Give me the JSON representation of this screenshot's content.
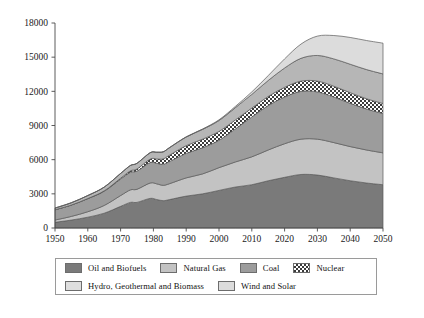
{
  "chart_data": {
    "type": "area",
    "stacked": true,
    "title": "",
    "xlabel": "",
    "ylabel": "",
    "xlim": [
      1950,
      2050
    ],
    "ylim": [
      0,
      18000
    ],
    "yticks": [
      0,
      3000,
      6000,
      9000,
      12000,
      15000,
      18000
    ],
    "ytick_labels": [
      "0",
      "3000",
      "6000",
      "9000",
      "12000",
      "15000",
      "18000"
    ],
    "xticks": [
      1950,
      1960,
      1970,
      1980,
      1990,
      2000,
      2010,
      2020,
      2030,
      2040,
      2050
    ],
    "xtick_labels": [
      "1950",
      "1960",
      "1970",
      "1980",
      "1990",
      "2000",
      "2010",
      "2020",
      "2030",
      "2040",
      "2050"
    ],
    "grid": false,
    "legend_position": "below",
    "x": [
      1950,
      1955,
      1960,
      1965,
      1970,
      1973,
      1975,
      1979,
      1981,
      1983,
      1985,
      1990,
      1995,
      2000,
      2005,
      2010,
      2015,
      2020,
      2025,
      2030,
      2035,
      2040,
      2045,
      2050
    ],
    "series": [
      {
        "name": "Oil and Biofuels",
        "color": "#7a7a7a",
        "pattern": "solid",
        "values": [
          500,
          700,
          950,
          1300,
          1900,
          2250,
          2250,
          2600,
          2500,
          2400,
          2500,
          2800,
          3000,
          3300,
          3600,
          3800,
          4150,
          4450,
          4700,
          4650,
          4400,
          4150,
          3950,
          3800
        ]
      },
      {
        "name": "Natural Gas",
        "color": "#c3c3c3",
        "pattern": "solid",
        "values": [
          200,
          320,
          480,
          680,
          950,
          1100,
          1150,
          1350,
          1380,
          1350,
          1400,
          1600,
          1750,
          2000,
          2200,
          2450,
          2700,
          2950,
          3100,
          3150,
          3100,
          3000,
          2900,
          2800
        ]
      },
      {
        "name": "Coal",
        "color": "#9c9c9c",
        "pattern": "solid",
        "values": [
          900,
          1000,
          1150,
          1250,
          1450,
          1550,
          1600,
          1800,
          1800,
          1850,
          1950,
          2150,
          2300,
          2400,
          2900,
          3500,
          3900,
          4100,
          4200,
          4150,
          4000,
          3800,
          3600,
          3450
        ]
      },
      {
        "name": "Nuclear",
        "color": "#f2f2f2",
        "pattern": "checkered",
        "values": [
          0,
          0,
          10,
          30,
          70,
          120,
          180,
          300,
          380,
          470,
          560,
          680,
          750,
          780,
          790,
          780,
          800,
          850,
          900,
          950,
          950,
          930,
          900,
          880
        ]
      },
      {
        "name": "Hydro, Geothermal and Biomass",
        "color": "#b6b6b6",
        "pattern": "solid",
        "values": [
          150,
          200,
          260,
          330,
          420,
          470,
          500,
          560,
          590,
          620,
          660,
          760,
          860,
          960,
          1080,
          1200,
          1400,
          1700,
          2000,
          2250,
          2400,
          2500,
          2560,
          2600
        ]
      },
      {
        "name": "Wind and Solar",
        "color": "#dcdcdc",
        "pattern": "solid",
        "values": [
          0,
          0,
          0,
          0,
          0,
          0,
          0,
          0,
          0,
          0,
          5,
          15,
          30,
          60,
          110,
          220,
          430,
          800,
          1250,
          1700,
          2050,
          2350,
          2550,
          2700
        ]
      }
    ],
    "totals": [
      1750,
      2220,
      2850,
      3590,
      4790,
      5490,
      5680,
      6610,
      6650,
      6690,
      7075,
      8005,
      8690,
      9500,
      10680,
      11950,
      13380,
      14850,
      16150,
      16850,
      16900,
      16730,
      16460,
      16230
    ]
  },
  "legend": {
    "rows": [
      [
        {
          "label": "Oil and Biofuels",
          "swatch": "#7a7a7a",
          "pattern": "solid"
        },
        {
          "label": "Natural Gas",
          "swatch": "#c3c3c3",
          "pattern": "solid"
        },
        {
          "label": "Coal",
          "swatch": "#9c9c9c",
          "pattern": "solid"
        },
        {
          "label": "Nuclear",
          "swatch": "#f2f2f2",
          "pattern": "checkered"
        }
      ],
      [
        {
          "label": "Hydro, Geothermal and Biomass",
          "swatch": "#dedede",
          "pattern": "solid"
        },
        {
          "label": "Wind and Solar",
          "swatch": "#dcdcdc",
          "pattern": "solid"
        }
      ]
    ]
  },
  "colors": {
    "axis": "#4a4a4a",
    "outline": "#5a5a5a",
    "text": "#111111",
    "legend_border": "#9a9a9a",
    "background": "#ffffff"
  }
}
